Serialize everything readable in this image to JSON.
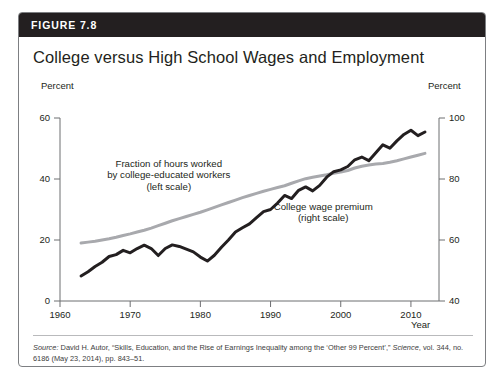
{
  "figure": {
    "number_label": "FIGURE 7.8",
    "title": "College versus High School Wages and Employment",
    "header_bg": "#231f20"
  },
  "source": {
    "prefix": "Source:",
    "body_1": " David H. Autor, “Skills, Education, and the Rise of Earnings Inequality among the ‘Other 99 Percent’,” ",
    "journal": "Science",
    "body_2": ", vol. 344, no. 6186 (May 23, 2014), pp. 843–51."
  },
  "chart_data": {
    "type": "line",
    "title": "College versus High School Wages and Employment",
    "xlabel": "Year",
    "ylabel": "Percent",
    "y2label": "Percent",
    "xlim": [
      1960,
      2014
    ],
    "ylim": [
      0,
      60
    ],
    "y2lim": [
      40,
      100
    ],
    "xticks": [
      1960,
      1970,
      1980,
      1990,
      2000,
      2010
    ],
    "xtick_labels": [
      "1960",
      "1970",
      "1980",
      "1990",
      "2000",
      "2010"
    ],
    "yticks": [
      0,
      20,
      40,
      60
    ],
    "ytick_labels": [
      "0",
      "20",
      "40",
      "60"
    ],
    "y2ticks": [
      40,
      60,
      80,
      100
    ],
    "y2tick_labels": [
      "40",
      "60",
      "80",
      "100"
    ],
    "grid": false,
    "legend_position": "inline-annotations",
    "annotations": [
      {
        "name": "fraction-hours-label",
        "lines": [
          "Fraction of hours worked",
          "by college-educated workers",
          "(left scale)"
        ],
        "x": 1975.5,
        "y_axis": "left",
        "y": 44
      },
      {
        "name": "college-wage-premium-label",
        "lines": [
          "College wage premium",
          "(right scale)"
        ],
        "x": 1997.5,
        "y_axis": "right",
        "y": 70
      }
    ],
    "series": [
      {
        "name": "Fraction of hours worked by college-educated workers",
        "axis": "left",
        "color": "#a8a9ad",
        "width": 3.0,
        "x": [
          1963,
          1964,
          1965,
          1966,
          1967,
          1968,
          1969,
          1970,
          1971,
          1972,
          1973,
          1974,
          1975,
          1976,
          1977,
          1978,
          1979,
          1980,
          1981,
          1982,
          1983,
          1984,
          1985,
          1986,
          1987,
          1988,
          1989,
          1990,
          1991,
          1992,
          1993,
          1994,
          1995,
          1996,
          1997,
          1998,
          1999,
          2000,
          2001,
          2002,
          2003,
          2004,
          2005,
          2006,
          2007,
          2008,
          2009,
          2010,
          2011,
          2012
        ],
        "values": [
          19.0,
          19.3,
          19.6,
          20.0,
          20.4,
          20.9,
          21.5,
          22.0,
          22.6,
          23.2,
          23.9,
          24.7,
          25.5,
          26.3,
          27.0,
          27.7,
          28.4,
          29.1,
          29.9,
          30.7,
          31.5,
          32.3,
          33.1,
          33.9,
          34.6,
          35.3,
          36.0,
          36.6,
          37.2,
          37.8,
          38.6,
          39.4,
          40.1,
          40.6,
          41.0,
          41.4,
          41.9,
          42.3,
          42.8,
          43.6,
          44.2,
          44.6,
          44.9,
          45.1,
          45.5,
          46.0,
          46.6,
          47.2,
          47.8,
          48.4
        ]
      },
      {
        "name": "College wage premium",
        "axis": "right",
        "color": "#231f20",
        "width": 3.0,
        "x": [
          1963,
          1964,
          1965,
          1966,
          1967,
          1968,
          1969,
          1970,
          1971,
          1972,
          1973,
          1974,
          1975,
          1976,
          1977,
          1978,
          1979,
          1980,
          1981,
          1982,
          1983,
          1984,
          1985,
          1986,
          1987,
          1988,
          1989,
          1990,
          1991,
          1992,
          1993,
          1994,
          1995,
          1996,
          1997,
          1998,
          1999,
          2000,
          2001,
          2002,
          2003,
          2004,
          2005,
          2006,
          2007,
          2008,
          2009,
          2010,
          2011,
          2012
        ],
        "values": [
          48.2,
          49.6,
          51.3,
          52.7,
          54.6,
          55.2,
          56.6,
          55.8,
          57.2,
          58.3,
          57.2,
          54.9,
          57.2,
          58.4,
          57.9,
          57.0,
          56.1,
          54.4,
          53.1,
          55.0,
          57.6,
          60.0,
          62.6,
          64.0,
          65.3,
          67.3,
          69.3,
          70.0,
          72.1,
          74.6,
          73.6,
          76.3,
          77.4,
          76.1,
          77.9,
          80.6,
          82.4,
          83.0,
          84.1,
          86.3,
          87.2,
          86.0,
          88.6,
          91.2,
          90.1,
          92.5,
          94.6,
          96.0,
          94.2,
          95.4
        ]
      }
    ]
  }
}
